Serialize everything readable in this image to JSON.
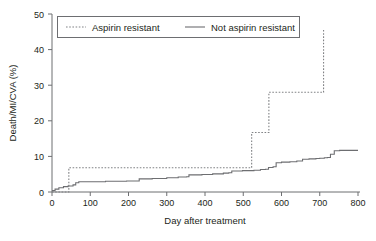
{
  "chart_data": {
    "type": "line",
    "title": "",
    "xlabel": "Day after treatment",
    "ylabel": "Death/MI/CVA (%)",
    "xlim": [
      0,
      800
    ],
    "ylim": [
      0,
      50
    ],
    "xticks": [
      0,
      100,
      200,
      300,
      400,
      500,
      600,
      700,
      800
    ],
    "yticks": [
      0,
      10,
      20,
      30,
      40,
      50
    ],
    "xtick_labels": [
      "0",
      "100",
      "200",
      "300",
      "400",
      "500",
      "600",
      "700",
      "800"
    ],
    "ytick_labels": [
      "0",
      "10",
      "20",
      "30",
      "40",
      "50"
    ],
    "grid": false,
    "legend_position": "top-center",
    "style": "kaplan-meier step curves (cumulative event rate)",
    "series": [
      {
        "name": "Aspirin resistant",
        "line_style": "dashed",
        "color": "#808285",
        "points": [
          [
            0,
            0.0
          ],
          [
            40,
            0.0
          ],
          [
            44,
            6.8
          ],
          [
            518,
            6.8
          ],
          [
            522,
            16.7
          ],
          [
            563,
            16.7
          ],
          [
            567,
            28.0
          ],
          [
            706,
            28.0
          ],
          [
            710,
            46.0
          ]
        ]
      },
      {
        "name": "Not aspirin resistant",
        "line_style": "solid",
        "color": "#6d6e71",
        "points": [
          [
            0,
            0.4
          ],
          [
            8,
            0.8
          ],
          [
            18,
            1.2
          ],
          [
            30,
            1.5
          ],
          [
            42,
            1.7
          ],
          [
            55,
            2.0
          ],
          [
            62,
            2.6
          ],
          [
            70,
            2.9
          ],
          [
            100,
            2.9
          ],
          [
            140,
            3.0
          ],
          [
            170,
            3.0
          ],
          [
            195,
            3.1
          ],
          [
            222,
            3.1
          ],
          [
            228,
            3.7
          ],
          [
            262,
            3.8
          ],
          [
            300,
            4.0
          ],
          [
            330,
            4.2
          ],
          [
            352,
            4.3
          ],
          [
            358,
            4.8
          ],
          [
            392,
            4.9
          ],
          [
            420,
            5.1
          ],
          [
            448,
            5.3
          ],
          [
            462,
            5.4
          ],
          [
            470,
            5.9
          ],
          [
            498,
            6.0
          ],
          [
            518,
            6.0
          ],
          [
            528,
            6.1
          ],
          [
            545,
            6.3
          ],
          [
            558,
            6.4
          ],
          [
            566,
            6.9
          ],
          [
            578,
            7.1
          ],
          [
            586,
            8.2
          ],
          [
            600,
            8.4
          ],
          [
            622,
            8.5
          ],
          [
            640,
            8.7
          ],
          [
            655,
            9.2
          ],
          [
            672,
            9.3
          ],
          [
            690,
            9.4
          ],
          [
            700,
            9.5
          ],
          [
            712,
            9.6
          ],
          [
            720,
            9.7
          ],
          [
            728,
            10.6
          ],
          [
            738,
            11.6
          ],
          [
            752,
            11.7
          ],
          [
            800,
            11.7
          ]
        ]
      }
    ],
    "legend": [
      {
        "label": "Aspirin resistant",
        "style": "dashed"
      },
      {
        "label": "Not aspirin resistant",
        "style": "solid"
      }
    ]
  }
}
